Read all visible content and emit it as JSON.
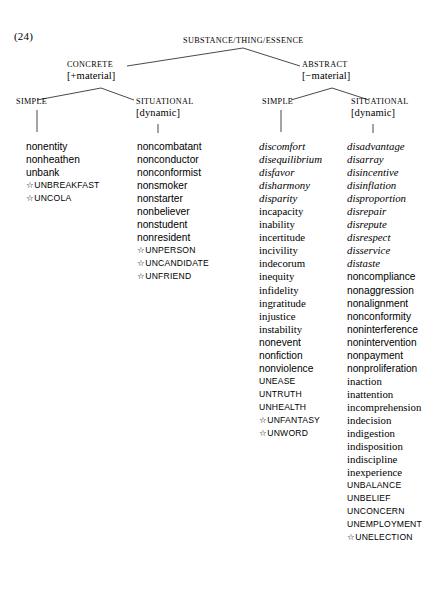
{
  "example_number": "(24)",
  "tree": {
    "root": {
      "label": "SUBSTANCE/THING/ESSENCE"
    },
    "concrete": {
      "label": "CONCRETE",
      "feature": "[+material]"
    },
    "abstract": {
      "label": "ABSTRACT",
      "feature": "[−material]"
    },
    "concrete_simple": {
      "label": "SIMPLE",
      "feature": ""
    },
    "concrete_situational": {
      "label": "SITUATIONAL",
      "feature": "[dynamic]"
    },
    "abstract_simple": {
      "label": "SIMPLE",
      "feature": ""
    },
    "abstract_situational": {
      "label": "SITUATIONAL",
      "feature": "[dynamic]"
    }
  },
  "columns": [
    {
      "id": "concrete-simple",
      "words": [
        {
          "text": "nonentity",
          "style": "sans"
        },
        {
          "text": "nonheathen",
          "style": "sans"
        },
        {
          "text": "unbank",
          "style": "sans"
        },
        {
          "text": "UNBREAKFAST",
          "style": "caps",
          "starred": true
        },
        {
          "text": "UNCOLA",
          "style": "caps",
          "starred": true
        }
      ]
    },
    {
      "id": "concrete-situational",
      "words": [
        {
          "text": "noncombatant",
          "style": "sans"
        },
        {
          "text": "nonconductor",
          "style": "sans"
        },
        {
          "text": "nonconformist",
          "style": "sans"
        },
        {
          "text": "nonsmoker",
          "style": "sans"
        },
        {
          "text": "nonstarter",
          "style": "sans"
        },
        {
          "text": "nonbeliever",
          "style": "sans"
        },
        {
          "text": "nonstudent",
          "style": "sans"
        },
        {
          "text": "nonresident",
          "style": "sans"
        },
        {
          "text": "UNPERSON",
          "style": "caps",
          "starred": true
        },
        {
          "text": "UNCANDIDATE",
          "style": "caps",
          "starred": true
        },
        {
          "text": "UNFRIEND",
          "style": "caps",
          "starred": true
        }
      ]
    },
    {
      "id": "abstract-simple",
      "words": [
        {
          "text": "discomfort",
          "style": "ital"
        },
        {
          "text": "disequilibrium",
          "style": "ital"
        },
        {
          "text": "disfavor",
          "style": "ital"
        },
        {
          "text": "disharmony",
          "style": "ital"
        },
        {
          "text": "disparity",
          "style": "ital"
        },
        {
          "text": "incapacity",
          "style": "serif"
        },
        {
          "text": "inability",
          "style": "serif"
        },
        {
          "text": "incertitude",
          "style": "serif"
        },
        {
          "text": "incivility",
          "style": "serif"
        },
        {
          "text": "indecorum",
          "style": "serif"
        },
        {
          "text": "inequity",
          "style": "serif"
        },
        {
          "text": "infidelity",
          "style": "serif"
        },
        {
          "text": "ingratitude",
          "style": "serif"
        },
        {
          "text": "injustice",
          "style": "serif"
        },
        {
          "text": "instability",
          "style": "serif"
        },
        {
          "text": "nonevent",
          "style": "sans"
        },
        {
          "text": "nonfiction",
          "style": "sans"
        },
        {
          "text": "nonviolence",
          "style": "sans"
        },
        {
          "text": "UNEASE",
          "style": "caps"
        },
        {
          "text": "UNTRUTH",
          "style": "caps"
        },
        {
          "text": "UNHEALTH",
          "style": "caps"
        },
        {
          "text": "UNFANTASY",
          "style": "caps",
          "starred": true
        },
        {
          "text": "UNWORD",
          "style": "caps",
          "starred": true
        }
      ]
    },
    {
      "id": "abstract-situational",
      "words": [
        {
          "text": "disadvantage",
          "style": "ital"
        },
        {
          "text": "disarray",
          "style": "ital"
        },
        {
          "text": "disincentive",
          "style": "ital"
        },
        {
          "text": "disinflation",
          "style": "ital"
        },
        {
          "text": "disproportion",
          "style": "ital"
        },
        {
          "text": "disrepair",
          "style": "ital"
        },
        {
          "text": "disrepute",
          "style": "ital"
        },
        {
          "text": "disrespect",
          "style": "ital"
        },
        {
          "text": "disservice",
          "style": "ital"
        },
        {
          "text": "distaste",
          "style": "ital"
        },
        {
          "text": "noncompliance",
          "style": "sans"
        },
        {
          "text": "nonaggression",
          "style": "sans"
        },
        {
          "text": "nonalignment",
          "style": "sans"
        },
        {
          "text": "nonconformity",
          "style": "sans"
        },
        {
          "text": "noninterference",
          "style": "sans"
        },
        {
          "text": "nonintervention",
          "style": "sans"
        },
        {
          "text": "nonpayment",
          "style": "sans"
        },
        {
          "text": "nonproliferation",
          "style": "sans"
        },
        {
          "text": "inaction",
          "style": "serif"
        },
        {
          "text": "inattention",
          "style": "serif"
        },
        {
          "text": "incomprehension",
          "style": "serif"
        },
        {
          "text": "indecision",
          "style": "serif"
        },
        {
          "text": "indigestion",
          "style": "serif"
        },
        {
          "text": "indisposition",
          "style": "serif"
        },
        {
          "text": "indiscipline",
          "style": "serif"
        },
        {
          "text": "inexperience",
          "style": "serif"
        },
        {
          "text": "UNBALANCE",
          "style": "caps"
        },
        {
          "text": "UNBELIEF",
          "style": "caps"
        },
        {
          "text": "UNCONCERN",
          "style": "caps"
        },
        {
          "text": "UNEMPLOYMENT",
          "style": "caps"
        },
        {
          "text": "UNELECTION",
          "style": "caps",
          "starred": true
        }
      ]
    }
  ]
}
